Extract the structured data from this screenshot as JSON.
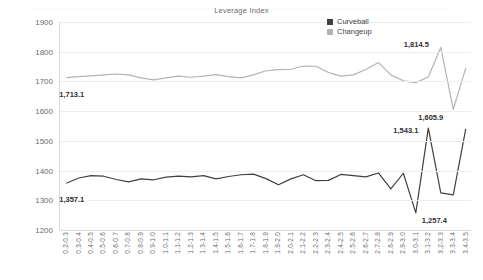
{
  "chart_data": {
    "type": "line",
    "title": "Leverage Index",
    "xlabel": "",
    "ylabel": "SPIN RATE (rpm)",
    "ylim": [
      1200,
      1900
    ],
    "yticks": [
      1900,
      1800,
      1700,
      1600,
      1500,
      1400,
      1300,
      1200
    ],
    "grid": true,
    "legend_position": "top-right",
    "categories": [
      "0.2-0.3",
      "0.3-0.4",
      "0.4-0.5",
      "0.5-0.6",
      "0.6-0.7",
      "0.7-0.8",
      "0.8-0.9",
      "0.9-1.0",
      "1.0-1.1",
      "1.1-1.2",
      "1.2-1.3",
      "1.3-1.4",
      "1.4-1.5",
      "1.5-1.6",
      "1.6-1.7",
      "1.7-1.8",
      "1.8-1.9",
      "1.9-2.0",
      "2.0-2.1",
      "2.1-2.2",
      "2.2-2.3",
      "2.3-2.4",
      "2.4-2.5",
      "2.5-2.6",
      "2.6-2.7",
      "2.7-2.8",
      "2.8-2.9",
      "2.9-3.0",
      "3.0-3.1",
      "3.1-3.2",
      "3.2-3.3",
      "3.3-3.4",
      "3.4-3.5"
    ],
    "series": [
      {
        "name": "Curveball",
        "color": "#404040",
        "values": [
          1357.1,
          1375.0,
          1383.0,
          1381.0,
          1370.0,
          1362.0,
          1372.0,
          1369.0,
          1378.0,
          1381.0,
          1379.0,
          1383.0,
          1372.0,
          1380.0,
          1386.0,
          1388.0,
          1373.0,
          1352.0,
          1372.0,
          1386.0,
          1366.0,
          1367.0,
          1387.0,
          1383.0,
          1379.0,
          1392.0,
          1338.0,
          1391.0,
          1257.4,
          1543.1,
          1325.0,
          1318.0,
          1540.0
        ],
        "labeled_points": [
          {
            "category": "0.2-0.3",
            "value": 1357.1,
            "label": "1,357.1"
          },
          {
            "category": "3.0-3.1",
            "value": 1257.4,
            "label": "1,257.4"
          },
          {
            "category": "3.1-3.2",
            "value": 1543.1,
            "label": "1,543.1"
          }
        ]
      },
      {
        "name": "Changeup",
        "color": "#b3b3b3",
        "values": [
          1713.1,
          1716.0,
          1719.0,
          1722.0,
          1725.0,
          1722.0,
          1712.0,
          1705.0,
          1712.0,
          1718.0,
          1714.0,
          1718.0,
          1723.0,
          1716.0,
          1712.0,
          1722.0,
          1736.0,
          1740.0,
          1741.0,
          1752.0,
          1751.0,
          1730.0,
          1718.0,
          1722.0,
          1740.0,
          1764.0,
          1722.0,
          1702.0,
          1696.0,
          1715.0,
          1814.5,
          1605.9,
          1745.0
        ],
        "labeled_points": [
          {
            "category": "0.2-0.3",
            "value": 1713.1,
            "label": "1,713.1"
          },
          {
            "category": "3.2-3.3",
            "value": 1814.5,
            "label": "1,814.5"
          },
          {
            "category": "3.3-3.4",
            "value": 1605.9,
            "label": "1,605.9"
          }
        ]
      }
    ]
  },
  "legend": {
    "items": [
      {
        "label": "Curveball",
        "color": "#404040"
      },
      {
        "label": "Changeup",
        "color": "#b3b3b3"
      }
    ]
  }
}
